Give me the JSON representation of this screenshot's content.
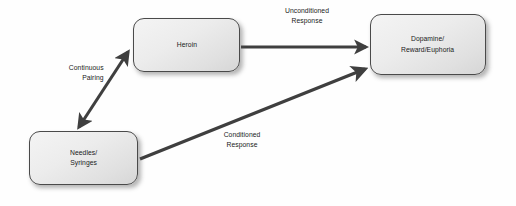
{
  "diagram": {
    "background_color": "#fefefe",
    "line_color": "#3f3f3f",
    "node_border_color": "#4a4a4a",
    "node_fill_color": "#ececec",
    "text_color": "#1a1a1a",
    "nodes": [
      {
        "id": "heroin",
        "label": "Heroin",
        "x": 133,
        "y": 18,
        "width": 107,
        "height": 54
      },
      {
        "id": "dopamine",
        "label": "Dopamine/\nReward/Euphoria",
        "x": 370,
        "y": 14,
        "width": 116,
        "height": 61
      },
      {
        "id": "needles",
        "label": "Needles/\nSyringes",
        "x": 29,
        "y": 131,
        "width": 109,
        "height": 54
      }
    ],
    "edges": [
      {
        "id": "continuous-pairing",
        "label": "Continuous\nPairing",
        "from": "needles",
        "to": "heroin",
        "arrowheads": "both"
      },
      {
        "id": "unconditioned-response",
        "label": "Unconditioned\nResponse",
        "from": "heroin",
        "to": "dopamine",
        "arrowheads": "end"
      },
      {
        "id": "conditioned-response",
        "label": "Conditioned\nResponse",
        "from": "needles",
        "to": "dopamine",
        "arrowheads": "end"
      }
    ]
  }
}
